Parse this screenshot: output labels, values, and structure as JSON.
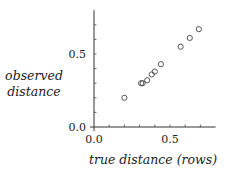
{
  "chart_data": {
    "type": "scatter",
    "title": "",
    "xlabel": "true distance (rows)",
    "ylabel_lines": [
      "observed",
      "distance"
    ],
    "ylabel": "observed distance",
    "xlim": [
      0.0,
      0.8
    ],
    "ylim": [
      0.0,
      0.8
    ],
    "x_ticks": [
      0.0,
      0.1,
      0.2,
      0.3,
      0.4,
      0.5,
      0.6,
      0.7
    ],
    "y_ticks": [
      0.0,
      0.1,
      0.2,
      0.3,
      0.4,
      0.5,
      0.6,
      0.7
    ],
    "x_tick_labels": [
      {
        "value": 0.0,
        "label": "0.0"
      },
      {
        "value": 0.5,
        "label": "0.5"
      }
    ],
    "y_tick_labels": [
      {
        "value": 0.0,
        "label": "0.0"
      },
      {
        "value": 0.5,
        "label": "0.5"
      }
    ],
    "grid": false,
    "legend": null,
    "marker": "open-circle",
    "series": [
      {
        "name": "observations",
        "x": [
          0.2,
          0.31,
          0.32,
          0.35,
          0.38,
          0.4,
          0.44,
          0.57,
          0.63,
          0.69
        ],
        "y": [
          0.2,
          0.3,
          0.3,
          0.32,
          0.36,
          0.38,
          0.43,
          0.55,
          0.61,
          0.67
        ]
      }
    ]
  }
}
